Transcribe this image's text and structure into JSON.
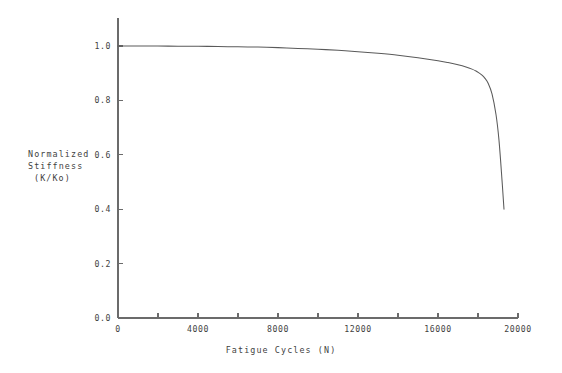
{
  "chart_data": {
    "type": "line",
    "title": "",
    "xlabel": "Fatigue Cycles  (N)",
    "ylabel_lines": [
      "Normalized",
      "Stiffness",
      "(K/Ko)"
    ],
    "ylabel": "Normalized Stiffness (K/Ko)",
    "xlim": [
      0,
      20000
    ],
    "ylim": [
      0.0,
      1.0
    ],
    "grid": false,
    "legend": "none",
    "x_major_ticks": [
      0,
      4000,
      8000,
      12000,
      16000,
      20000
    ],
    "x_major_tick_labels": [
      "0",
      "4000",
      "8000",
      "12000",
      "16000",
      "20000"
    ],
    "x_minor_ticks": [
      2000,
      6000,
      10000,
      14000,
      18000
    ],
    "y_major_ticks": [
      0.0,
      0.2,
      0.4,
      0.6,
      0.8,
      1.0
    ],
    "y_major_tick_labels": [
      "0.0",
      "0.2",
      "0.4",
      "0.6",
      "0.8",
      "1.0"
    ],
    "series": [
      {
        "name": "Normalized Stiffness",
        "color": "#5a5a5a",
        "x": [
          0,
          500,
          1000,
          2000,
          3000,
          4000,
          5000,
          6000,
          7000,
          8000,
          9000,
          10000,
          11000,
          12000,
          13000,
          14000,
          15000,
          16000,
          16500,
          17000,
          17400,
          17700,
          17900,
          18050,
          18200,
          18350,
          18500,
          18700,
          18900,
          19050,
          19200,
          19300
        ],
        "y": [
          1.0,
          1.0,
          1.0,
          1.0,
          0.999,
          0.999,
          0.998,
          0.997,
          0.996,
          0.994,
          0.991,
          0.988,
          0.984,
          0.979,
          0.973,
          0.966,
          0.957,
          0.946,
          0.939,
          0.931,
          0.923,
          0.915,
          0.908,
          0.901,
          0.893,
          0.881,
          0.864,
          0.824,
          0.748,
          0.653,
          0.507,
          0.4
        ]
      }
    ]
  },
  "axes_geometry": {
    "plot_left": 118,
    "plot_right": 518,
    "plot_bottom": 318,
    "plot_top": 46,
    "y_axis_top_overhang": 18
  },
  "colors": {
    "axis": "#6b6b6b",
    "curve": "#5a5a5a",
    "text": "#3f3f3f",
    "background": "#ffffff"
  }
}
